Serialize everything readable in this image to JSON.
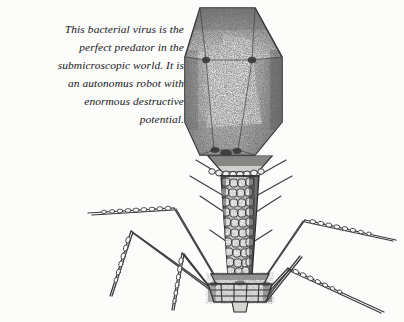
{
  "page": {
    "background_color": "#fcfcfb",
    "ink_color": "#16161a"
  },
  "caption": {
    "full_text": "This bacterial virus is the perfect predator in the submicroscopic world. It is an autonomus robot with enormous destructive potential.",
    "align": "right",
    "style": "italic-serif",
    "lines": [
      "This bacterial virus is the",
      "perfect predator in the",
      "submicroscopic world. It is",
      "an autonomus robot with",
      "enormous destructive",
      "potential."
    ]
  },
  "illustration": {
    "subject": "bacteriophage-virus",
    "technique": "stipple-pen-and-ink",
    "line_color": "#2b2b2e",
    "fill_color": "#d9d9d6",
    "parts": [
      {
        "name": "capsid-head",
        "label": "Icosahedral head",
        "shape": "hexagon"
      },
      {
        "name": "collar",
        "label": "Collar",
        "shape": "beaded-band"
      },
      {
        "name": "tail-sheath",
        "label": "Contractile tail sheath",
        "shape": "segmented-helix"
      },
      {
        "name": "baseplate",
        "label": "Baseplate",
        "shape": "hexagonal-box"
      },
      {
        "name": "tail-fibers",
        "label": "Tail fibers",
        "count": 6
      },
      {
        "name": "tail-pins",
        "label": "Short tail pins",
        "count": 4
      }
    ]
  }
}
